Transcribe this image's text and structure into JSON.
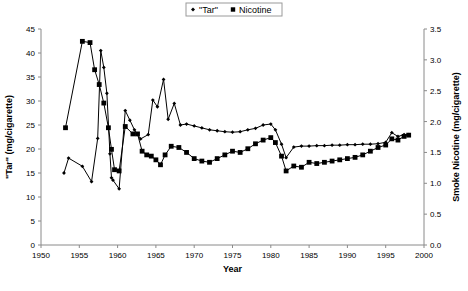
{
  "chart_data": {
    "type": "line",
    "title": "",
    "xlabel": "Year",
    "ylabel": "\"Tar\" (mg/cigarette)",
    "y2label": "Smoke Nicotine (mg/cigarette)",
    "xlim": [
      1950,
      2000
    ],
    "ylim": [
      0,
      45
    ],
    "y2lim": [
      0.0,
      3.5
    ],
    "xticks": [
      1950,
      1955,
      1960,
      1965,
      1970,
      1975,
      1980,
      1985,
      1990,
      1995,
      2000
    ],
    "yticks": [
      0,
      5,
      10,
      15,
      20,
      25,
      30,
      35,
      40,
      45
    ],
    "y2ticks": [
      "0.0",
      "0.5",
      "1.0",
      "1.5",
      "2.0",
      "2.5",
      "3.0",
      "3.5"
    ],
    "grid": false,
    "legend_position": "top-center",
    "legend": [
      {
        "name": "\"Tar\"",
        "marker": "diamond",
        "color": "#000000"
      },
      {
        "name": "Nicotine",
        "marker": "square",
        "color": "#000000"
      }
    ],
    "series": [
      {
        "name": "\"Tar\"",
        "marker": "diamond",
        "axis": "left",
        "units": "mg/cigarette",
        "points": [
          [
            1953,
            15.0
          ],
          [
            1953.6,
            18.1
          ],
          [
            1955.4,
            16.4
          ],
          [
            1956.6,
            13.2
          ],
          [
            1957.4,
            22.2
          ],
          [
            1957.8,
            40.5
          ],
          [
            1958.2,
            37.0
          ],
          [
            1958.6,
            31.6
          ],
          [
            1959.0,
            19.0
          ],
          [
            1959.2,
            14.0
          ],
          [
            1959.4,
            13.5
          ],
          [
            1960.2,
            11.7
          ],
          [
            1961.0,
            28.0
          ],
          [
            1961.6,
            26.0
          ],
          [
            1962.2,
            24.0
          ],
          [
            1963.0,
            22.1
          ],
          [
            1964.0,
            23.0
          ],
          [
            1964.6,
            30.2
          ],
          [
            1965.2,
            28.8
          ],
          [
            1966.0,
            34.5
          ],
          [
            1966.6,
            26.2
          ],
          [
            1967.4,
            29.5
          ],
          [
            1968.2,
            25.0
          ],
          [
            1969.0,
            25.2
          ],
          [
            1970.0,
            24.8
          ],
          [
            1971.0,
            24.4
          ],
          [
            1972.0,
            24.0
          ],
          [
            1973.0,
            23.8
          ],
          [
            1974.0,
            23.6
          ],
          [
            1975.0,
            23.5
          ],
          [
            1976.0,
            23.6
          ],
          [
            1977.0,
            24.0
          ],
          [
            1978.0,
            24.3
          ],
          [
            1979.0,
            25.0
          ],
          [
            1980.0,
            25.2
          ],
          [
            1980.6,
            24.0
          ],
          [
            1981.4,
            21.0
          ],
          [
            1982.0,
            18.2
          ],
          [
            1983.0,
            20.4
          ],
          [
            1984.0,
            20.6
          ],
          [
            1985.0,
            20.6
          ],
          [
            1986.0,
            20.7
          ],
          [
            1987.0,
            20.7
          ],
          [
            1988.0,
            20.8
          ],
          [
            1989.0,
            20.8
          ],
          [
            1990.0,
            20.9
          ],
          [
            1991.0,
            20.9
          ],
          [
            1992.0,
            21.0
          ],
          [
            1993.0,
            21.0
          ],
          [
            1994.0,
            21.1
          ],
          [
            1995.0,
            21.4
          ],
          [
            1995.8,
            23.4
          ],
          [
            1996.6,
            22.6
          ],
          [
            1997.4,
            23.0
          ],
          [
            1998.0,
            23.0
          ]
        ]
      },
      {
        "name": "Nicotine",
        "marker": "square",
        "axis": "right",
        "units": "mg/cigarette",
        "points": [
          [
            1953.2,
            1.9
          ],
          [
            1955.4,
            3.3
          ],
          [
            1956.4,
            3.28
          ],
          [
            1957.0,
            2.84
          ],
          [
            1957.6,
            2.6
          ],
          [
            1958.2,
            2.3
          ],
          [
            1958.8,
            1.9
          ],
          [
            1959.2,
            1.55
          ],
          [
            1959.6,
            1.22
          ],
          [
            1960.2,
            1.2
          ],
          [
            1961.0,
            1.92
          ],
          [
            1962.0,
            1.8
          ],
          [
            1962.6,
            1.8
          ],
          [
            1963.2,
            1.52
          ],
          [
            1963.8,
            1.46
          ],
          [
            1964.4,
            1.44
          ],
          [
            1965.0,
            1.38
          ],
          [
            1965.6,
            1.3
          ],
          [
            1966.2,
            1.46
          ],
          [
            1967.0,
            1.6
          ],
          [
            1968.0,
            1.58
          ],
          [
            1969.0,
            1.5
          ],
          [
            1970.0,
            1.4
          ],
          [
            1971.0,
            1.36
          ],
          [
            1972.0,
            1.34
          ],
          [
            1973.0,
            1.4
          ],
          [
            1974.0,
            1.46
          ],
          [
            1975.0,
            1.52
          ],
          [
            1976.0,
            1.5
          ],
          [
            1977.0,
            1.56
          ],
          [
            1978.0,
            1.64
          ],
          [
            1979.0,
            1.7
          ],
          [
            1980.0,
            1.74
          ],
          [
            1980.6,
            1.66
          ],
          [
            1981.4,
            1.44
          ],
          [
            1982.0,
            1.2
          ],
          [
            1983.0,
            1.28
          ],
          [
            1984.0,
            1.26
          ],
          [
            1985.0,
            1.34
          ],
          [
            1986.0,
            1.32
          ],
          [
            1987.0,
            1.34
          ],
          [
            1988.0,
            1.36
          ],
          [
            1989.0,
            1.38
          ],
          [
            1990.0,
            1.4
          ],
          [
            1991.0,
            1.42
          ],
          [
            1992.0,
            1.46
          ],
          [
            1993.0,
            1.52
          ],
          [
            1994.0,
            1.58
          ],
          [
            1995.0,
            1.62
          ],
          [
            1995.8,
            1.72
          ],
          [
            1996.6,
            1.7
          ],
          [
            1997.4,
            1.76
          ],
          [
            1998.0,
            1.78
          ]
        ]
      }
    ]
  }
}
